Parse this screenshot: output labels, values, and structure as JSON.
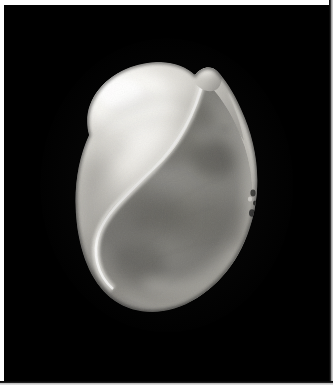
{
  "image": {
    "subject": "snail shell",
    "view": "aperture view",
    "background_color": "#000000",
    "frame_color": "#fdfdfd",
    "palette": {
      "background": "#000000",
      "frame": "#fdfdfd",
      "frame_shadow": "#b9b9b9",
      "shell_highlight": "#f2f1ee",
      "shell_light": "#d9d7d2",
      "shell_mid": "#a9a7a2",
      "shell_shadow": "#6e6d6a",
      "aperture_interior": "#7f7e7b",
      "aperture_deep_shadow": "#5a5a58",
      "outer_lip_rim": "#cfcdc8",
      "speckle": "#1c1c1c"
    },
    "regions": [
      {
        "name": "body-whorl",
        "description": "large bright left dome of the shell"
      },
      {
        "name": "spire-apex",
        "description": "small pointed tip at top right of the whorl"
      },
      {
        "name": "columella-lip",
        "description": "bright S-curved inner lip sweeping down-left"
      },
      {
        "name": "aperture-interior",
        "description": "broad mid-gray mottled opening"
      },
      {
        "name": "outer-lip",
        "description": "bright rim along the right outer margin"
      },
      {
        "name": "basal-margin",
        "description": "rounded bottom edge of the aperture"
      },
      {
        "name": "edge-speckles",
        "description": "small dark flecks on the right outer margin"
      }
    ]
  },
  "layout": {
    "width_px": 333,
    "height_px": 385,
    "photo_left_px": 4,
    "photo_top_px": 5,
    "photo_width_px": 325,
    "photo_height_px": 376,
    "shell_bbox": {
      "x": 58,
      "y": 65,
      "w": 195,
      "h": 265
    }
  }
}
